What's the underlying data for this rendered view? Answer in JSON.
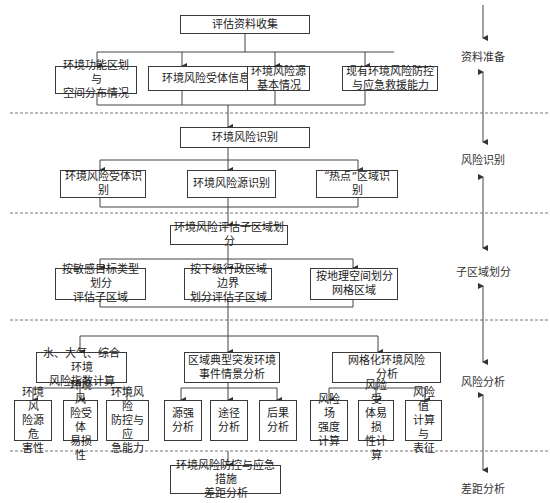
{
  "diagram": {
    "type": "flowchart",
    "phases": [
      {
        "id": "p1",
        "label": "资料准备"
      },
      {
        "id": "p2",
        "label": "风险识别"
      },
      {
        "id": "p3",
        "label": "子区域划分"
      },
      {
        "id": "p4",
        "label": "风险分析"
      },
      {
        "id": "p5",
        "label": "差距分析"
      }
    ],
    "nodes": {
      "collect": "评估资料收集",
      "func_zone": "环境功能区划与\n空间分布情况",
      "receptor_info": "环境风险受体信息",
      "source_basic": "环境风险源\n基本情况",
      "existing_capacity": "现有环境风险防控\n与应急救援能力",
      "identify": "环境风险识别",
      "receptor_id": "环境风险受体识别",
      "source_id": "环境风险源识别",
      "hotspot_id": "“热点”区域识别",
      "subregion": "环境风险评估子区域划分",
      "by_target": "按敏感目标类型划分\n评估子区域",
      "by_admin": "按下级行政区域边界\n划分评估子区域",
      "by_grid": "按地理空间划分\n网格区域",
      "index_calc": "水、大气、综合环境\n风险指数计算",
      "scenario": "区域典型突发环境\n事件情景分析",
      "grid_risk": "网格化环境风险\n分析",
      "hazard": "环境风\n险源危\n害性",
      "vulnerability": "环境风\n险受体\n易损性",
      "control_capacity": "环境风险\n防控与应\n急能力",
      "source_strength": "源强\n分析",
      "pathway": "途径\n分析",
      "consequence": "后果\n分析",
      "field_intensity": "风险场\n强度\n计算",
      "receptor_vuln_calc": "风险受\n体易损\n性计算",
      "risk_value": "风险值\n计算与\n表征",
      "gap": "环境风险防控与应急措施\n差距分析"
    }
  }
}
